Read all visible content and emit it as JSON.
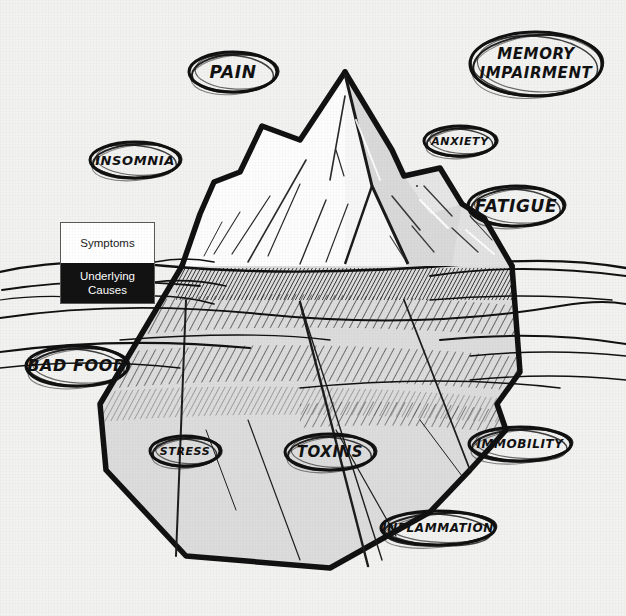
{
  "diagram": {
    "background_color": "#f2f2f1",
    "ink_color": "#111111",
    "water_line_y": 266
  },
  "legend": {
    "above_label": "Symptoms",
    "below_label": "Underlying\nCauses",
    "above_bg": "#ffffff",
    "above_fg": "#1a1a1a",
    "below_bg": "#121212",
    "below_fg": "#ffffff"
  },
  "bubbles": [
    {
      "id": "pain",
      "label": "PAIN",
      "zone": "symptoms",
      "x": 185,
      "y": 48,
      "w": 96,
      "h": 48,
      "font": 17
    },
    {
      "id": "memory-impairment",
      "label": "MEMORY\nIMPAIRMENT",
      "zone": "symptoms",
      "x": 466,
      "y": 28,
      "w": 140,
      "h": 72,
      "font": 15
    },
    {
      "id": "insomnia",
      "label": "INSOMNIA",
      "zone": "symptoms",
      "x": 86,
      "y": 138,
      "w": 98,
      "h": 44,
      "font": 13
    },
    {
      "id": "anxiety",
      "label": "ANXIETY",
      "zone": "symptoms",
      "x": 420,
      "y": 122,
      "w": 80,
      "h": 38,
      "font": 11
    },
    {
      "id": "fatigue",
      "label": "FATIGUE",
      "zone": "symptoms",
      "x": 464,
      "y": 182,
      "w": 104,
      "h": 48,
      "font": 17
    },
    {
      "id": "bad-food",
      "label": "BAD FOOD",
      "zone": "causes",
      "x": 22,
      "y": 342,
      "w": 110,
      "h": 48,
      "font": 16
    },
    {
      "id": "stress",
      "label": "STRESS",
      "zone": "causes",
      "x": 146,
      "y": 432,
      "w": 78,
      "h": 38,
      "font": 11
    },
    {
      "id": "toxins",
      "label": "TOXINS",
      "zone": "causes",
      "x": 281,
      "y": 430,
      "w": 98,
      "h": 44,
      "font": 15
    },
    {
      "id": "immobility",
      "label": "IMMOBILITY",
      "zone": "causes",
      "x": 465,
      "y": 423,
      "w": 110,
      "h": 42,
      "font": 12
    },
    {
      "id": "inflammation",
      "label": "INFLAMMATION",
      "zone": "causes",
      "x": 377,
      "y": 507,
      "w": 122,
      "h": 42,
      "font": 12
    }
  ],
  "chart_data": {
    "type": "diagram",
    "groups": [
      {
        "name": "Symptoms",
        "position": "above water",
        "items": [
          "PAIN",
          "MEMORY IMPAIRMENT",
          "INSOMNIA",
          "ANXIETY",
          "FATIGUE"
        ]
      },
      {
        "name": "Underlying Causes",
        "position": "below water",
        "items": [
          "BAD FOOD",
          "STRESS",
          "TOXINS",
          "IMMOBILITY",
          "INFLAMMATION"
        ]
      }
    ]
  }
}
